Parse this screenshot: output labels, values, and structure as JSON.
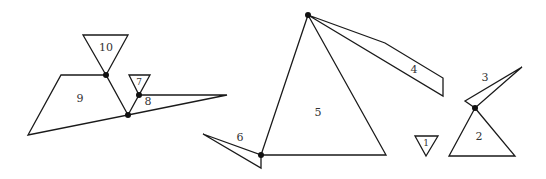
{
  "diagram": {
    "width": 546,
    "height": 179,
    "stroke_color": "#1a1a1a",
    "background": "#ffffff",
    "shapes": [
      {
        "id": "1",
        "label": "1",
        "points": "415,136 438,136 426,156",
        "label_pos": [
          426,
          143
        ],
        "small": true
      },
      {
        "id": "2",
        "label": "2",
        "points": "475,108 449,156 515,156",
        "label_pos": [
          479,
          137
        ]
      },
      {
        "id": "3",
        "label": "3",
        "points": "522,67 465,101 475,108",
        "label_pos": [
          485,
          78
        ]
      },
      {
        "id": "4",
        "label": "4",
        "points": "308,15 385,43 443,78 443,96",
        "label_pos": [
          414,
          70
        ]
      },
      {
        "id": "5",
        "label": "5",
        "points": "308,15 261,155 386,155",
        "label_pos": [
          318,
          113
        ]
      },
      {
        "id": "6",
        "label": "6",
        "points": "203,134 261,155 261,168",
        "label_pos": [
          240,
          138
        ]
      },
      {
        "id": "7",
        "label": "7",
        "points": "129,75 150,75 139,95",
        "label_pos": [
          139,
          82
        ],
        "small": true
      },
      {
        "id": "8",
        "label": "8",
        "points": "139,95 227,95 128,115",
        "label_pos": [
          148,
          102
        ]
      },
      {
        "id": "9",
        "label": "9",
        "points": "61,75 106,75 128,115 28,135",
        "label_pos": [
          80,
          99
        ]
      },
      {
        "id": "10",
        "label": "10",
        "points": "83,35 128,35 106,75",
        "label_pos": [
          106,
          48
        ]
      }
    ],
    "joints": [
      {
        "name": "joint-10-9",
        "x": 106,
        "y": 75
      },
      {
        "name": "joint-9-8",
        "x": 128,
        "y": 115
      },
      {
        "name": "joint-7-8",
        "x": 139,
        "y": 95
      },
      {
        "name": "joint-5-4",
        "x": 308,
        "y": 15
      },
      {
        "name": "joint-6-5",
        "x": 261,
        "y": 155
      },
      {
        "name": "joint-3-2",
        "x": 475,
        "y": 108
      }
    ]
  }
}
